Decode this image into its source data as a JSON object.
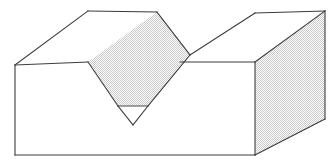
{
  "figure": {
    "background_color": "#ffffff",
    "line_color": "#3c3c3c",
    "shade_color": "#e8e8e8",
    "shade_style": "halftone-dither",
    "canvas": {
      "width": 335,
      "height": 168
    },
    "faces": [
      {
        "name": "top-face-left",
        "shaded": false,
        "points": "15,65 88,11 157,12 190,55 180,62 88,62"
      },
      {
        "name": "top-face-right",
        "shaded": false,
        "points": "190,55 255,13 325,11 255,62 180,62"
      },
      {
        "name": "front-face",
        "shaded": false,
        "points": "15,65 88,62 118,106 133,125 148,106 180,62 255,62 255,155 15,155"
      },
      {
        "name": "right-side-face",
        "shaded": true,
        "points": "255,62 325,11 325,119 255,155"
      },
      {
        "name": "groove-slope-face",
        "shaded": true,
        "points": "157,12 190,55 148,106 118,106 88,62"
      },
      {
        "name": "groove-bottom-triangle",
        "shaded": false,
        "points": "118,106 148,106 133,125"
      }
    ],
    "edges": [
      {
        "name": "top-back-left-edge",
        "d": "M15,65 L88,11"
      },
      {
        "name": "top-back-edge-left-span",
        "d": "M88,11 L157,12"
      },
      {
        "name": "top-back-edge-right-span",
        "d": "M255,13 L325,11"
      },
      {
        "name": "top-front-edge-left",
        "d": "M15,65 L88,62"
      },
      {
        "name": "top-front-edge-right",
        "d": "M180,62 L255,62"
      },
      {
        "name": "groove-ridge-left",
        "d": "M157,12 L190,55"
      },
      {
        "name": "groove-ridge-right",
        "d": "M190,55 L255,13"
      },
      {
        "name": "groove-face-left-edge",
        "d": "M88,62 L118,106"
      },
      {
        "name": "groove-face-right-edge",
        "d": "M190,55 L148,106"
      },
      {
        "name": "groove-root-line",
        "d": "M118,106 L148,106"
      },
      {
        "name": "groove-vee-left",
        "d": "M118,106 L133,125"
      },
      {
        "name": "groove-vee-right",
        "d": "M148,106 L133,125"
      },
      {
        "name": "front-left-vertical-edge",
        "d": "M15,65 L15,155"
      },
      {
        "name": "front-bottom-edge",
        "d": "M15,155 L255,155"
      },
      {
        "name": "right-vertical-edge",
        "d": "M255,62 L255,155"
      },
      {
        "name": "right-top-bevel-edge",
        "d": "M255,62 L325,11"
      },
      {
        "name": "right-far-vertical-edge",
        "d": "M325,11 L325,119"
      },
      {
        "name": "right-bottom-bevel-edge",
        "d": "M255,155 L325,119"
      }
    ]
  }
}
